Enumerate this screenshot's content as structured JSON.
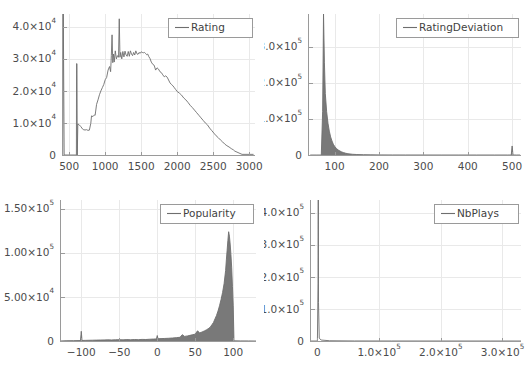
{
  "figure": {
    "title": "",
    "background": "#ffffff",
    "line_color": "#6e6e6e",
    "axis_color": "#9a9a9a",
    "grid_color": "#e9e9e9",
    "text_color": "#4c4c4c",
    "layout": "2x2 grid of histograms"
  },
  "chart_data": [
    {
      "type": "line",
      "id": "rating",
      "title": "",
      "legend": "Rating",
      "legend_position": "top-right",
      "xlabel": "",
      "ylabel": "",
      "grid": true,
      "xlim": [
        400,
        3080
      ],
      "ylim": [
        0,
        44000
      ],
      "xticks": [
        500,
        1000,
        1500,
        2000,
        2500,
        3000
      ],
      "xticklabels": [
        "500",
        "1000",
        "1500",
        "2000",
        "2500",
        "3000"
      ],
      "yticks": [
        0,
        10000,
        20000,
        30000,
        40000
      ],
      "yticklabels": [
        "0",
        "1.0×10⁴",
        "2.0×10⁴",
        "3.0×10⁴",
        "4.0×10⁴"
      ],
      "note": "histogram outline of puzzle Rating; tall narrow spike at ~600 reaching 2.85e4 plus clipped spike at left edge; main mode plateau ~3.1e4 between 1400-1650; sharp peaks 4.25e4 at 1195 and 3.75e4 at 1095",
      "x": [
        410,
        418,
        430,
        600,
        602,
        608,
        612,
        620,
        640,
        660,
        690,
        700,
        720,
        740,
        760,
        780,
        800,
        810,
        830,
        850,
        860,
        880,
        900,
        920,
        940,
        960,
        980,
        1000,
        1020,
        1040,
        1060,
        1075,
        1085,
        1095,
        1105,
        1115,
        1125,
        1140,
        1155,
        1170,
        1185,
        1195,
        1205,
        1215,
        1230,
        1245,
        1260,
        1275,
        1290,
        1305,
        1320,
        1335,
        1350,
        1365,
        1380,
        1395,
        1410,
        1425,
        1440,
        1455,
        1470,
        1485,
        1500,
        1515,
        1530,
        1545,
        1560,
        1575,
        1590,
        1605,
        1620,
        1640,
        1660,
        1680,
        1700,
        1720,
        1740,
        1760,
        1780,
        1800,
        1820,
        1840,
        1860,
        1880,
        1900,
        1920,
        1940,
        1960,
        1980,
        2000,
        2030,
        2060,
        2090,
        2120,
        2150,
        2180,
        2210,
        2240,
        2270,
        2300,
        2330,
        2360,
        2390,
        2420,
        2450,
        2480,
        2510,
        2540,
        2570,
        2600,
        2630,
        2660,
        2690,
        2720,
        2750,
        2780,
        2800,
        2830,
        2900,
        3000,
        3060
      ],
      "y": [
        0,
        44000,
        0,
        0,
        28500,
        28500,
        0,
        9700,
        9400,
        8900,
        8000,
        7900,
        7800,
        7900,
        7700,
        7750,
        9900,
        12200,
        12000,
        12500,
        12400,
        15800,
        17200,
        18800,
        20000,
        21000,
        22000,
        23500,
        24200,
        26500,
        27600,
        26000,
        31000,
        37500,
        28800,
        31500,
        29000,
        32500,
        30000,
        31000,
        30500,
        42500,
        30500,
        32000,
        30000,
        32300,
        30600,
        32400,
        31200,
        30800,
        32300,
        30800,
        32500,
        31500,
        31000,
        32000,
        31200,
        32500,
        31600,
        31400,
        32000,
        31700,
        32200,
        32000,
        31900,
        32000,
        31700,
        31300,
        31500,
        30700,
        30200,
        29000,
        28300,
        28000,
        26500,
        27200,
        26800,
        26000,
        25700,
        25000,
        24400,
        24700,
        24300,
        23400,
        22500,
        22000,
        21600,
        21000,
        20400,
        19800,
        19300,
        18700,
        17800,
        17200,
        16400,
        15500,
        14800,
        14000,
        13200,
        12400,
        11600,
        10800,
        10000,
        9400,
        8400,
        7600,
        6800,
        6000,
        5400,
        4700,
        4100,
        3400,
        2900,
        2500,
        2000,
        1600,
        1200,
        900,
        200,
        200,
        200,
        200
      ]
    },
    {
      "type": "line",
      "id": "rating_deviation",
      "title": "",
      "legend": "RatingDeviation",
      "legend_position": "top-right",
      "xlabel": "",
      "ylabel": "",
      "grid": true,
      "xlim": [
        40,
        520
      ],
      "ylim": [
        0,
        390000
      ],
      "xticks": [
        100,
        200,
        300,
        400,
        500
      ],
      "xticklabels": [
        "100",
        "200",
        "300",
        "400",
        "500"
      ],
      "yticks": [
        0,
        100000,
        200000,
        300000
      ],
      "yticklabels": [
        "0",
        "1.0×10⁵",
        "2.0×10⁵",
        "3.0×10⁵"
      ],
      "note": "extremely right-skewed; vertical clipped spike at ~75 exceeding axis top (>3.9e5), rapid exponential decay to near zero by ~130; small spike at 500 of about 2.5e4",
      "x": [
        45,
        60,
        70,
        73,
        75,
        77,
        79,
        82,
        85,
        88,
        91,
        94,
        97,
        100,
        104,
        108,
        112,
        116,
        120,
        125,
        130,
        140,
        150,
        165,
        180,
        200,
        230,
        260,
        300,
        340,
        380,
        420,
        460,
        490,
        498,
        500,
        502,
        510,
        518
      ],
      "y": [
        0,
        0,
        0,
        120000,
        390000,
        255000,
        170000,
        120000,
        88000,
        66000,
        50000,
        39000,
        30000,
        24000,
        18000,
        14000,
        11000,
        8500,
        6600,
        4800,
        3500,
        2000,
        1300,
        800,
        500,
        300,
        160,
        100,
        60,
        40,
        30,
        25,
        20,
        18,
        18,
        25000,
        18,
        15,
        0
      ]
    },
    {
      "type": "line",
      "id": "popularity",
      "title": "",
      "legend": "Popularity",
      "legend_position": "top-right",
      "xlabel": "",
      "ylabel": "",
      "grid": true,
      "xlim": [
        -128,
        130
      ],
      "ylim": [
        0,
        160000
      ],
      "xticks": [
        -100,
        -50,
        0,
        50,
        100
      ],
      "xticklabels": [
        "−100",
        "−50",
        "0",
        "50",
        "100"
      ],
      "yticks": [
        0,
        50000,
        100000,
        150000
      ],
      "yticklabels": [
        "0",
        "5.00×10⁴",
        "1.00×10⁵",
        "1.50×10⁵"
      ],
      "note": "dense noisy histogram; essentially flat near zero from -128 to ~30, gradual rise from 40, steep climb past 75, sharp peak ~1.24e5 at 94, abrupt drop to 0 just past 100; small isolated spike ~1.1e4 at -100 and ~6e3 at 0",
      "x": [
        -128,
        -120,
        -110,
        -101,
        -100,
        -99,
        -95,
        -90,
        -85,
        -80,
        -75,
        -70,
        -65,
        -60,
        -55,
        -50,
        -45,
        -40,
        -35,
        -30,
        -25,
        -20,
        -15,
        -10,
        -5,
        -1,
        0,
        1,
        5,
        10,
        15,
        20,
        25,
        30,
        33,
        36,
        40,
        43,
        46,
        50,
        53,
        56,
        59,
        62,
        65,
        68,
        70,
        72,
        74,
        76,
        78,
        80,
        82,
        84,
        86,
        88,
        90,
        91,
        92,
        93,
        94,
        95,
        96,
        97,
        98,
        99,
        100,
        101,
        102,
        110,
        120,
        130
      ],
      "y": [
        0,
        300,
        400,
        500,
        11000,
        600,
        700,
        800,
        900,
        1000,
        1100,
        1200,
        1300,
        1200,
        1400,
        1500,
        1300,
        1600,
        1400,
        1700,
        1500,
        1800,
        1700,
        2000,
        2200,
        2400,
        6200,
        2600,
        2700,
        2900,
        3100,
        3400,
        3800,
        4200,
        7200,
        5200,
        5800,
        6400,
        7000,
        7800,
        11500,
        9200,
        10200,
        11400,
        12800,
        14500,
        16000,
        18500,
        21000,
        25000,
        29000,
        34000,
        40000,
        47000,
        55000,
        65000,
        80000,
        92000,
        103000,
        114000,
        124000,
        119000,
        110000,
        98000,
        83000,
        62000,
        40000,
        200,
        150,
        120,
        100,
        0
      ]
    },
    {
      "type": "line",
      "id": "nb_plays",
      "title": "",
      "legend": "NbPlays",
      "legend_position": "top-right",
      "xlabel": "",
      "ylabel": "",
      "grid": true,
      "xlim": [
        -12000,
        330000
      ],
      "ylim": [
        0,
        440000
      ],
      "xticks": [
        0,
        100000,
        200000,
        300000
      ],
      "xticklabels": [
        "0",
        "1.0×10⁵",
        "2.0×10⁵",
        "3.0×10⁵"
      ],
      "yticks": [
        0,
        100000,
        200000,
        300000,
        400000
      ],
      "yticklabels": [
        "0",
        "1.0×10⁵",
        "2.0×10⁵",
        "3.0×10⁵",
        "4.0×10⁵"
      ],
      "note": "almost all mass in first bin; single clipped vertical spike at x~1500 exceeding top of axis; flat at zero across the rest of the range",
      "x": [
        -12000,
        0,
        1200,
        1500,
        1800,
        3000,
        6000,
        20000,
        60000,
        120000,
        200000,
        280000,
        330000
      ],
      "y": [
        0,
        0,
        180000,
        440000,
        120000,
        9000,
        3000,
        800,
        200,
        80,
        40,
        20,
        0
      ]
    }
  ]
}
